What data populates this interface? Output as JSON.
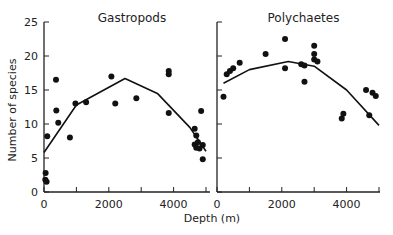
{
  "chart_data": [
    {
      "type": "scatter",
      "title": "Gastropods",
      "xlabel": "Depth (m)",
      "ylabel": "Number of species",
      "xlim": [
        0,
        5200
      ],
      "ylim": [
        0,
        25
      ],
      "xticks": [
        0,
        2000,
        4000
      ],
      "yticks": [
        0,
        5,
        10,
        15,
        20,
        25
      ],
      "points": [
        [
          50,
          2.8
        ],
        [
          40,
          1.8
        ],
        [
          80,
          1.5
        ],
        [
          100,
          8.2
        ],
        [
          370,
          16.5
        ],
        [
          380,
          12
        ],
        [
          440,
          10.2
        ],
        [
          800,
          8
        ],
        [
          970,
          13
        ],
        [
          1300,
          13.2
        ],
        [
          2080,
          17
        ],
        [
          2200,
          13
        ],
        [
          2850,
          13.8
        ],
        [
          3850,
          17.8
        ],
        [
          3850,
          17.3
        ],
        [
          3850,
          11.6
        ],
        [
          4650,
          9.3
        ],
        [
          4700,
          8.3
        ],
        [
          4650,
          7
        ],
        [
          4700,
          6.5
        ],
        [
          4750,
          7.3
        ],
        [
          4800,
          6.4
        ],
        [
          4900,
          6.9
        ],
        [
          4850,
          11.9
        ],
        [
          4900,
          4.8
        ]
      ],
      "fit_curve": [
        [
          0,
          5.8
        ],
        [
          1000,
          12.8
        ],
        [
          2500,
          16.7
        ],
        [
          3500,
          14.5
        ],
        [
          4500,
          9.5
        ],
        [
          5000,
          6
        ]
      ]
    },
    {
      "type": "scatter",
      "title": "Polychaetes",
      "xlabel": "Depth (m)",
      "ylabel": "",
      "xlim": [
        0,
        5000
      ],
      "ylim": [
        0,
        25
      ],
      "xticks": [
        0,
        2000,
        4000
      ],
      "points": [
        [
          200,
          14
        ],
        [
          300,
          17.3
        ],
        [
          400,
          17.8
        ],
        [
          500,
          18.2
        ],
        [
          700,
          19
        ],
        [
          1500,
          20.3
        ],
        [
          2100,
          22.5
        ],
        [
          2100,
          18.2
        ],
        [
          2600,
          18.8
        ],
        [
          2700,
          16.2
        ],
        [
          2700,
          18.6
        ],
        [
          3000,
          21.5
        ],
        [
          3000,
          20.3
        ],
        [
          3000,
          19.5
        ],
        [
          3100,
          19.2
        ],
        [
          3850,
          10.8
        ],
        [
          3900,
          11.5
        ],
        [
          4600,
          15
        ],
        [
          4700,
          11.3
        ],
        [
          4800,
          14.6
        ],
        [
          4900,
          14.1
        ]
      ],
      "fit_curve": [
        [
          200,
          16
        ],
        [
          1000,
          18
        ],
        [
          2200,
          19.2
        ],
        [
          3000,
          18.5
        ],
        [
          4000,
          15
        ],
        [
          5000,
          9.8
        ]
      ]
    }
  ]
}
